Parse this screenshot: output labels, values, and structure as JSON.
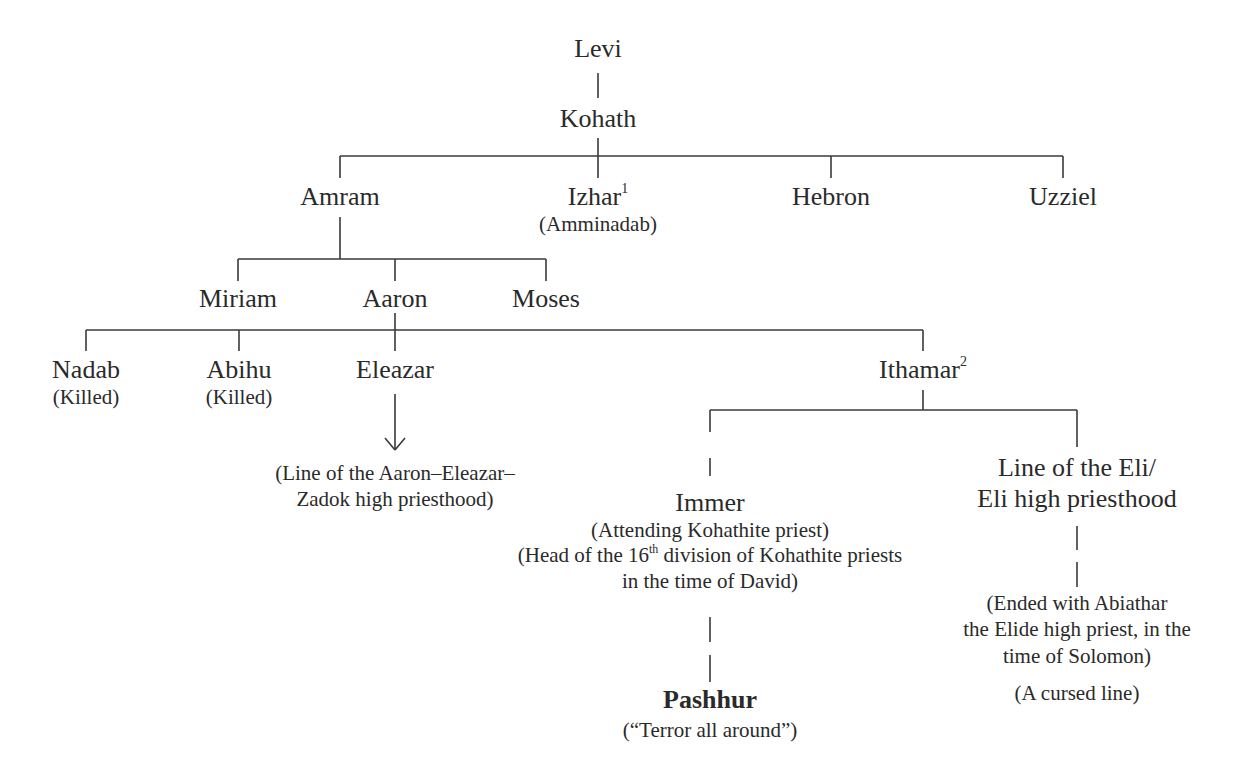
{
  "nodes": {
    "levi": {
      "name": "Levi"
    },
    "kohath": {
      "name": "Kohath"
    },
    "amram": {
      "name": "Amram"
    },
    "izhar": {
      "name": "Izhar",
      "footnote": "1",
      "note": "(Amminadab)"
    },
    "hebron": {
      "name": "Hebron"
    },
    "uzziel": {
      "name": "Uzziel"
    },
    "miriam": {
      "name": "Miriam"
    },
    "aaron": {
      "name": "Aaron"
    },
    "moses": {
      "name": "Moses"
    },
    "nadab": {
      "name": "Nadab",
      "note": "(Killed)"
    },
    "abihu": {
      "name": "Abihu",
      "note": "(Killed)"
    },
    "eleazar": {
      "name": "Eleazar",
      "note_line1": "(Line of the Aaron–Eleazar–",
      "note_line2": "Zadok high priesthood)"
    },
    "ithamar": {
      "name": "Ithamar",
      "footnote": "2"
    },
    "immer": {
      "name": "Immer",
      "note1": "(Attending Kohathite priest)",
      "note2_pre": "(Head of the 16",
      "note2_sup": "th",
      "note2_post": " division of Kohathite priests",
      "note2_line2": "in the time of David)"
    },
    "eli_line": {
      "name_line1": "Line of the Eli/",
      "name_line2": "Eli high priesthood",
      "note_line1": "(Ended with Abiathar",
      "note_line2": "the Elide high priest, in the",
      "note_line3": "time of Solomon)",
      "note2": "(A cursed line)"
    },
    "pashhur": {
      "name": "Pashhur",
      "note": "(“Terror all around”)"
    }
  },
  "colors": {
    "line": "#3a3a3a",
    "text": "#2a2a2a",
    "background": "#ffffff"
  }
}
